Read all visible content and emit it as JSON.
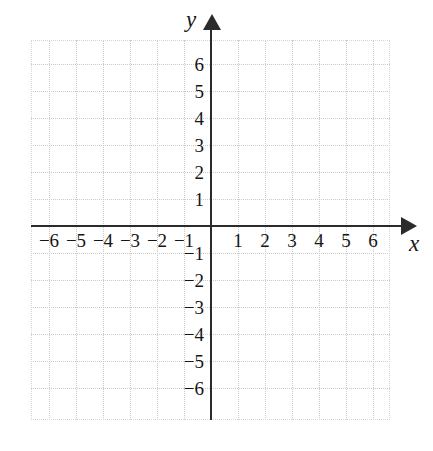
{
  "figure": {
    "name": "cartesian-coordinate-plane",
    "background_color": "#ffffff",
    "grid_color": "#c9c9c9",
    "axis_color": "#2b2b2b",
    "label_color": "#151515"
  },
  "axes": {
    "x": {
      "name": "x",
      "tick_labels": [
        "−6",
        "−5",
        "−4",
        "−3",
        "−2",
        "−1",
        "1",
        "2",
        "3",
        "4",
        "5",
        "6"
      ],
      "tick_values": [
        -6,
        -5,
        -4,
        -3,
        -2,
        -1,
        1,
        2,
        3,
        4,
        5,
        6
      ],
      "arrow": "right"
    },
    "y": {
      "name": "y",
      "tick_labels": [
        "6",
        "5",
        "4",
        "3",
        "2",
        "1",
        "−1",
        "−2",
        "−3",
        "−4",
        "−5",
        "−6"
      ],
      "tick_values": [
        6,
        5,
        4,
        3,
        2,
        1,
        -1,
        -2,
        -3,
        -4,
        -5,
        -6
      ],
      "arrow": "up"
    }
  },
  "chart_data": {
    "type": "scatter",
    "title": "",
    "subtitle": "",
    "xlabel": "x",
    "ylabel": "y",
    "xlim": [
      -6.6,
      6.9
    ],
    "xticks": [
      -6,
      -5,
      -4,
      -3,
      -2,
      -1,
      1,
      2,
      3,
      4,
      5,
      6
    ],
    "xticklabels": [
      "−6",
      "−5",
      "−4",
      "−3",
      "−2",
      "−1",
      "1",
      "2",
      "3",
      "4",
      "5",
      "6"
    ],
    "ylim": [
      -6.9,
      6.9
    ],
    "yticks": [
      6,
      5,
      4,
      3,
      2,
      1,
      -1,
      -2,
      -3,
      -4,
      -5,
      -6
    ],
    "yticklabels": [
      "6",
      "5",
      "4",
      "3",
      "2",
      "1",
      "−1",
      "−2",
      "−3",
      "−4",
      "−5",
      "−6"
    ],
    "grid": true,
    "grid_style": "dotted",
    "grid_spacing": 1,
    "legend": null,
    "series": [],
    "x": [],
    "values": [],
    "annotations": []
  }
}
